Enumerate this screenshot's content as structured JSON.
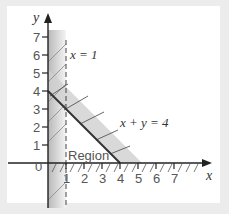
{
  "diagram": {
    "type": "linear-inequality-region",
    "axes": {
      "x_label": "x",
      "y_label": "y",
      "origin_label": "0",
      "x_ticks": [
        "1",
        "2",
        "3",
        "4",
        "5",
        "6",
        "7"
      ],
      "y_ticks": [
        "1",
        "2",
        "3",
        "4",
        "5",
        "6",
        "7"
      ]
    },
    "lines": [
      {
        "label": "x = 1",
        "style": "dashed",
        "x_equals": 1
      },
      {
        "label": "x + y = 4",
        "style": "solid",
        "from": [
          0,
          4
        ],
        "to": [
          4,
          0
        ]
      }
    ],
    "region_label": "Region",
    "shading": {
      "left_of_y_axis_side": "x < 1 excluded (hatched strip 0..1)",
      "above_line": "x + y > 4 excluded",
      "below_x_axis": "y < 0 excluded"
    },
    "colors": {
      "background": "#ececec",
      "panel": "#ffffff",
      "axis": "#222222",
      "shade": "#bdbdbd",
      "line": "#333333"
    }
  }
}
